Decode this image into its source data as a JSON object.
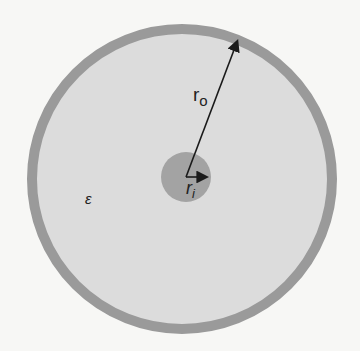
{
  "diagram": {
    "type": "coaxial-cross-section",
    "labels": {
      "outer_radius": "r",
      "outer_sub": "o",
      "inner_radius": "r",
      "inner_sub": "i",
      "permittivity": "ε"
    },
    "colors": {
      "background": "#f7f7f5",
      "dielectric": "#dcdcdc",
      "outer_conductor": "#9a9a9a",
      "inner_conductor": "#a3a3a3",
      "arrow": "#1a1a1a"
    }
  }
}
